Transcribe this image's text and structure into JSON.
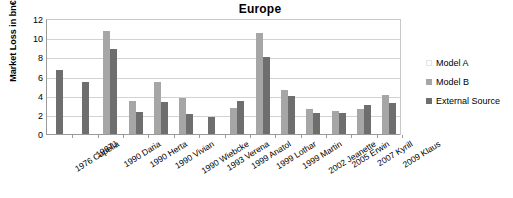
{
  "chart_data": {
    "type": "bar",
    "title": "Europe",
    "xlabel": "",
    "ylabel": "Market Loss in bn€",
    "ylim": [
      0,
      12
    ],
    "yticks": [
      0,
      2,
      4,
      6,
      8,
      10,
      12
    ],
    "grid": true,
    "legend_position": "right",
    "categories": [
      "1976 Capella",
      "1987J",
      "1990 Daria",
      "1990 Herta",
      "1990 Vivian",
      "1990 Wiebcke",
      "1993 Verena",
      "1999 Anatol",
      "1999 Lothar",
      "1999 Martin",
      "2002 Jeanette",
      "2005 Erwin",
      "2007 Kyrill",
      "2009 Klaus"
    ],
    "series": [
      {
        "name": "Model A",
        "color": "#fbfbfb",
        "values": [
          null,
          null,
          null,
          null,
          null,
          null,
          null,
          null,
          null,
          null,
          null,
          null,
          null,
          null
        ]
      },
      {
        "name": "Model B",
        "color": "#a6a6a6",
        "values": [
          null,
          null,
          10.7,
          3.4,
          5.4,
          3.8,
          null,
          2.7,
          10.5,
          4.6,
          2.6,
          2.4,
          2.6,
          4.1
        ]
      },
      {
        "name": "External Source",
        "color": "#6e6e6e",
        "values": [
          6.7,
          5.4,
          8.9,
          2.3,
          3.3,
          2.1,
          1.8,
          3.4,
          8.0,
          4.0,
          2.2,
          2.2,
          3.0,
          3.2
        ]
      }
    ]
  },
  "legend": {
    "items": [
      {
        "label": "Model A"
      },
      {
        "label": "Model B"
      },
      {
        "label": "External Source"
      }
    ]
  }
}
